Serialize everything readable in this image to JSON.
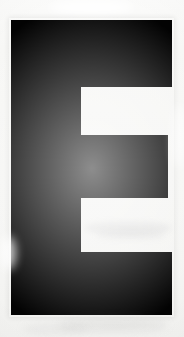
{
  "image": {
    "kind": "scanned-letterform",
    "subject": "E",
    "subject_label": "E",
    "description": "Large black sans-serif capital letter E on off-white scanned paper",
    "alt_text": "Capital letter E"
  },
  "canvas": {
    "width": 184,
    "height": 337
  },
  "colors": {
    "ink": "#030303",
    "paper": "#f6f6f4",
    "paper_top": "#fbfbfa",
    "paper_bottom": "#f1f1ef",
    "notch": "#fcfcfb",
    "smudge": "#8c8c90"
  },
  "glyph": {
    "name": "letter-e",
    "character": "E",
    "ink_color": "#030303",
    "bounds": {
      "left": 11,
      "top": 20,
      "right": 172,
      "bottom": 315
    },
    "spine": {
      "left": 11,
      "top": 20,
      "right": 81,
      "bottom": 315
    },
    "arms": [
      {
        "name": "top-arm",
        "left": 11,
        "top": 20,
        "right": 172,
        "bottom": 87
      },
      {
        "name": "middle-arm",
        "left": 11,
        "top": 135,
        "right": 168,
        "bottom": 198
      },
      {
        "name": "bottom-arm",
        "left": 11,
        "top": 252,
        "right": 172,
        "bottom": 315
      }
    ],
    "counters": [
      {
        "name": "upper-counter",
        "left": 81,
        "top": 87,
        "right": 184,
        "bottom": 135
      },
      {
        "name": "lower-counter",
        "left": 81,
        "top": 198,
        "right": 184,
        "bottom": 252
      }
    ],
    "path": "M 11 20 L 172 20 L 172 87 L 81 87 L 81 135 L 168 135 L 168 198 L 81 198 L 81 252 L 172 252 L 172 315 L 11 315 Z"
  },
  "artifacts": {
    "top_highlight": "light scan flare across upper background",
    "lower_counter_smudge": "faint gray streak inside lower counter",
    "bottom_smudge": "faint gray blotch below the glyph"
  }
}
